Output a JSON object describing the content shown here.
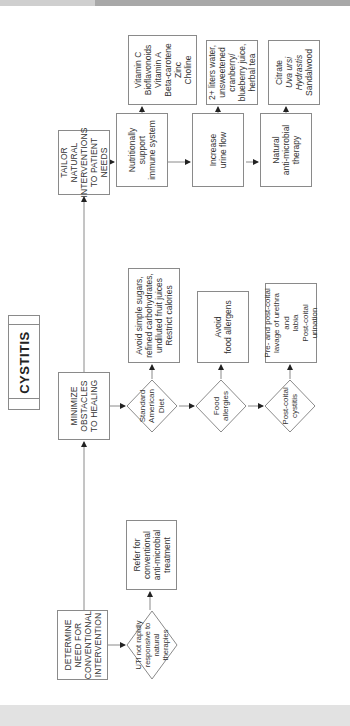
{
  "title": "CYSTITIS",
  "colors": {
    "line": "#8a8a8a",
    "text": "#333333",
    "band_dark": "#a8a8a8",
    "band_light": "#e2e2e2"
  },
  "orientation": "rotated 90 degrees counter-clockwise",
  "main_steps": {
    "determine": "DETERMINE\nNEED FOR\nCONVENTIONAL\nINTERVENTION",
    "minimize": "MINIMIZE\nOBSTACLES\nTO HEALING",
    "tailor": "TAILOR\nNATURAL\nINTERVENTIONS\nTO PATIENT\nNEEDS"
  },
  "determine_branch": {
    "decision": "UTI not rapidly\nresponsive to\nnatural\ntherapies",
    "action": "Refer for\nconventional\nanti-microbial\ntreatment"
  },
  "minimize_branch": [
    {
      "decision": "Standard\nAmerican\nDiet",
      "action": "Avoid simple sugars,\nrefined carbohydrates,\nundiluted fruit juices\nRestrict calories"
    },
    {
      "decision": "Food\nallergies",
      "action": "Avoid\nfood allergens"
    },
    {
      "decision": "Post-coital\ncystitis",
      "action": "Pre- and post-coital\nlavage of urethra and\nlabia\nPost-coital\nurination"
    }
  ],
  "tailor_branch": [
    {
      "step": "Nutritionally\nsupport\nimmune system",
      "detail": "Vitamin C\nBioflavonoids\nVitamin A\nBeta-carotene\nZinc\nCholine"
    },
    {
      "step": "Increase\nurine flow",
      "detail": "2+ liters water,\nunsweetened\ncranberry/\nblueberry juice,\nherbal tea"
    },
    {
      "step": "Natural\nanti-microbial\ntherapy",
      "detail_lines": [
        "Citrate",
        "Uva ursi",
        "Hydrastis",
        "Sandalwood"
      ],
      "italic_lines": [
        "Uva ursi",
        "Hydrastis"
      ]
    }
  ]
}
